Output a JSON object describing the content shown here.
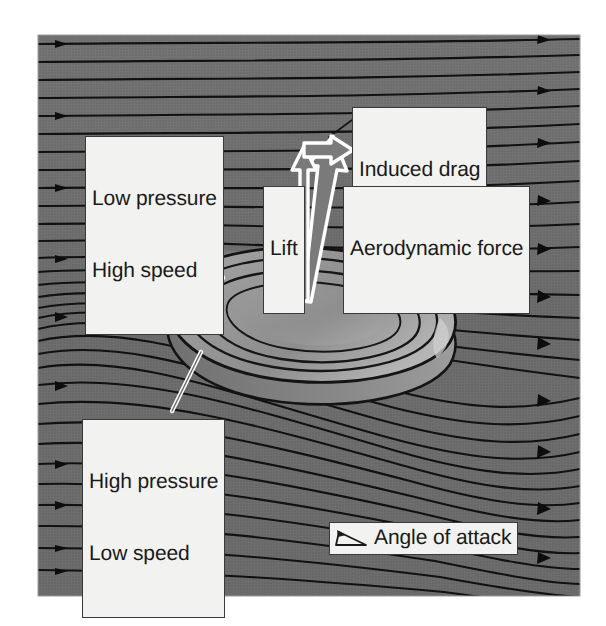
{
  "figure": {
    "background_color": "#ffffff",
    "plate_color": "#6e6e6e",
    "streamline_color": "#101010",
    "callout_fill": "#f2f2f0",
    "callout_border": "#3a3a3a",
    "callout_text_color": "#1a1a1a",
    "vector_outline_color": "#ffffff",
    "plate": {
      "x": 38,
      "y": 35,
      "width": 542,
      "height": 561
    }
  },
  "labels": {
    "low_pressure": {
      "line1": "Low pressure",
      "line2": "High speed"
    },
    "high_pressure": {
      "line1": "High pressure",
      "line2": "Low speed"
    },
    "induced_drag": "Induced drag",
    "lift": "Lift",
    "aerodynamic_force": "Aerodynamic force",
    "angle_of_attack": "Angle of attack"
  },
  "icons": {
    "angle_of_attack": "angle-of-attack-icon"
  },
  "vectors": [
    {
      "name": "lift",
      "label": "Lift",
      "direction": "up",
      "tail": {
        "x": 305,
        "y": 300
      },
      "head": {
        "x": 299,
        "y": 147
      }
    },
    {
      "name": "induced-drag",
      "label": "Induced drag",
      "direction": "right",
      "tail": {
        "x": 308,
        "y": 152
      },
      "head": {
        "x": 355,
        "y": 144
      }
    },
    {
      "name": "aerodynamic-force",
      "label": "Aerodynamic force",
      "direction": "up-right",
      "tail": {
        "x": 307,
        "y": 300
      },
      "head": {
        "x": 352,
        "y": 148
      }
    }
  ],
  "leader_lines": [
    {
      "name": "low-pressure-leader",
      "from": {
        "x": 188,
        "y": 190
      },
      "to": {
        "x": 223,
        "y": 278
      }
    },
    {
      "name": "high-pressure-leader",
      "from": {
        "x": 201,
        "y": 352
      },
      "to": {
        "x": 172,
        "y": 411
      }
    },
    {
      "name": "induced-drag-leader",
      "from": {
        "x": 352,
        "y": 121
      },
      "to": {
        "x": 330,
        "y": 136
      }
    }
  ],
  "streamlines": {
    "count": 30,
    "arrow_markers_per_line": 1,
    "description": "Horizontal incoming flow from the left, deflected downward after passing over the tilted disc"
  }
}
